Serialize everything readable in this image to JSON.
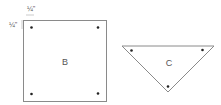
{
  "diagram": {
    "plate_b": {
      "label": "B",
      "shape": "square",
      "holes": 4
    },
    "plate_c": {
      "label": "C",
      "shape": "triangle",
      "holes": 3
    },
    "dimensions": {
      "top_offset": "¼\"",
      "left_offset": "¼\""
    },
    "colors": {
      "stroke": "#8a8a8a",
      "hole": "#222222",
      "text": "#555555"
    }
  }
}
